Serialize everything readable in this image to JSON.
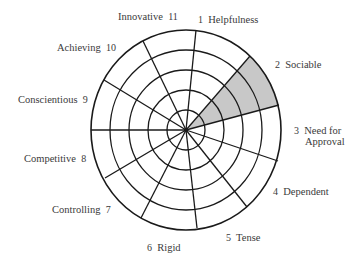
{
  "diagram": {
    "type": "polar-grid",
    "center": [
      186,
      130
    ],
    "radius_x": 95,
    "radius_y": 100,
    "rings": 5,
    "spoke_endpoints": [
      [
        196,
        30
      ],
      [
        250,
        56
      ],
      [
        279,
        105
      ],
      [
        278,
        161
      ],
      [
        247,
        207
      ],
      [
        197,
        228
      ],
      [
        141,
        218
      ],
      [
        105,
        178
      ],
      [
        91,
        130
      ],
      [
        104,
        80
      ],
      [
        143,
        41
      ]
    ],
    "shaded_sector": {
      "segment": 2,
      "from_spoke": 1,
      "to_spoke": 2,
      "fill": "#c8c8c8",
      "extent_rings": 5
    },
    "line_color": "#1a1a1a"
  },
  "labels": [
    {
      "id": "helpfulness",
      "num": "1",
      "text": "Helpfulness"
    },
    {
      "id": "sociable",
      "num": "2",
      "text": "Sociable"
    },
    {
      "id": "need-for-approval",
      "num": "3",
      "text": "Need for",
      "text2": "Approval"
    },
    {
      "id": "dependent",
      "num": "4",
      "text": "Dependent"
    },
    {
      "id": "tense",
      "num": "5",
      "text": "Tense"
    },
    {
      "id": "rigid",
      "num": "6",
      "text": "Rigid"
    },
    {
      "id": "controlling",
      "num": "7",
      "text": "Controlling"
    },
    {
      "id": "competitive",
      "num": "8",
      "text": "Competitive"
    },
    {
      "id": "conscientious",
      "num": "9",
      "text": "Conscientious"
    },
    {
      "id": "achieving",
      "num": "10",
      "text": "Achieving"
    },
    {
      "id": "innovative",
      "num": "11",
      "text": "Innovative"
    }
  ]
}
